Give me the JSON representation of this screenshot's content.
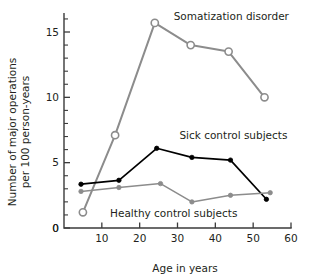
{
  "chart_data": {
    "type": "line",
    "title": "",
    "xlabel": "Age in years",
    "ylabel": "Number of major operations\nper 100 person-years",
    "ylabel_line1": "Number of major operations",
    "ylabel_line2": "per 100 person-years",
    "xlim": [
      0,
      60
    ],
    "ylim": [
      0,
      16.5
    ],
    "xticks": [
      0,
      10,
      20,
      30,
      40,
      50,
      60
    ],
    "xtick_labels": [
      "0",
      "10",
      "20",
      "30",
      "40",
      "50",
      "60"
    ],
    "yticks": [
      0,
      5,
      10,
      15
    ],
    "ytick_labels": [
      "0",
      "5",
      "10",
      "15"
    ],
    "y_minor_tick_step": 1,
    "grid": false,
    "legend_position": "inline-annotations",
    "series": [
      {
        "name": "Somatization disorder",
        "label": "Somatization disorder",
        "color": "#8c8c8c",
        "marker": "open-circle",
        "x": [
          5,
          13.5,
          24,
          33.5,
          43.5,
          53
        ],
        "values": [
          1.2,
          7.1,
          15.7,
          14.0,
          13.5,
          10.0
        ],
        "label_x": 29,
        "label_y": 15.9
      },
      {
        "name": "Sick control subjects",
        "label": "Sick control subjects",
        "color": "#000000",
        "marker": "filled-circle",
        "x": [
          4.5,
          14.5,
          24.5,
          33.8,
          44,
          53.5
        ],
        "values": [
          3.35,
          3.65,
          6.1,
          5.4,
          5.2,
          2.2
        ],
        "label_x": 30.5,
        "label_y": 6.8
      },
      {
        "name": "Healthy control subjects",
        "label": "Healthy control subjects",
        "color": "#8c8c8c",
        "marker": "filled-circle",
        "x": [
          4.5,
          14.5,
          25.5,
          33.8,
          44,
          54.5
        ],
        "values": [
          2.8,
          3.1,
          3.4,
          2.0,
          2.5,
          2.7
        ],
        "label_x": 29,
        "label_y": 0.85
      }
    ]
  },
  "axes": {
    "x_title": "Age in years",
    "y_title_line1": "Number of major operations",
    "y_title_line2": "per 100 person-years"
  }
}
